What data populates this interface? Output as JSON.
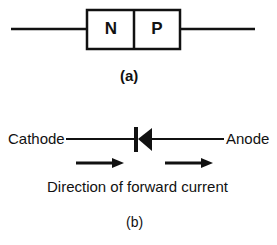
{
  "figure_a": {
    "regions": [
      "N",
      "P"
    ],
    "caption": "(a)"
  },
  "figure_b": {
    "left_terminal": "Cathode",
    "right_terminal": "Anode",
    "direction_label": "Direction of forward current",
    "caption": "(b)"
  },
  "colors": {
    "ink": "#111111",
    "background": "#ffffff"
  }
}
